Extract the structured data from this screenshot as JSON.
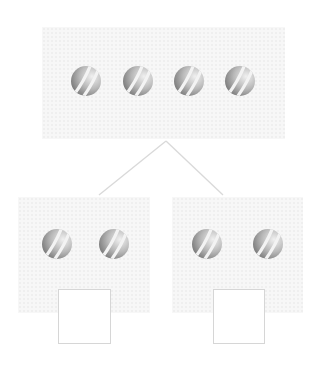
{
  "diagram": {
    "type": "number-bond",
    "whole": {
      "count": 4,
      "object": "striped-ball"
    },
    "parts": [
      {
        "count": 2,
        "object": "striped-ball",
        "answer": ""
      },
      {
        "count": 2,
        "object": "striped-ball",
        "answer": ""
      }
    ]
  },
  "colors": {
    "panel_bg": "#f7f7f7",
    "connector_line": "#d9d9d9",
    "answer_box_border": "#d6d6d6",
    "ball_dark": "#8a8a8a",
    "ball_light": "#e8e8e8",
    "ball_stripe": "#f4f4f4"
  }
}
